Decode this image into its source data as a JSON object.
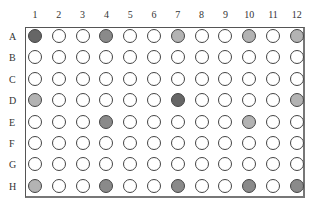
{
  "plate": {
    "format": "96-well",
    "columns": [
      "1",
      "2",
      "3",
      "4",
      "5",
      "6",
      "7",
      "8",
      "9",
      "10",
      "11",
      "12"
    ],
    "rows": [
      "A",
      "B",
      "C",
      "D",
      "E",
      "F",
      "G",
      "H"
    ],
    "fill_colors": {
      "empty": "#ffffff",
      "dark": "#666666",
      "medium": "#8a8a8a",
      "light": "#b3b3b3"
    },
    "filled_wells": {
      "A1": "dark",
      "A4": "medium",
      "A7": "light",
      "A10": "light",
      "A12": "light",
      "D1": "light",
      "D7": "dark",
      "D12": "light",
      "E4": "medium",
      "E10": "light",
      "H1": "light",
      "H4": "medium",
      "H7": "medium",
      "H10": "medium",
      "H12": "medium"
    }
  }
}
